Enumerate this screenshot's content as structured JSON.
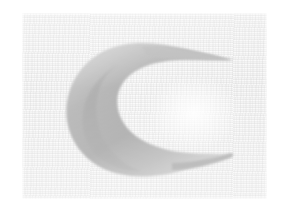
{
  "page": {
    "width": 289,
    "height": 218,
    "background_color": "#ffffff"
  },
  "photo": {
    "name": "scanned-photo-region",
    "left": 22,
    "top": 13,
    "width": 245,
    "height": 186,
    "paper_color": "#f1f1f1",
    "paper_highlight": "#f7f7f7",
    "paper_shadow": "#ebebeb",
    "texture": "horizontal-fibrous-grain",
    "caption": ""
  },
  "artwork": {
    "name": "crescent-moon",
    "subject": "crescent moon",
    "orientation": "opening-faces-right",
    "fill_color": "#b2b2b2",
    "fill_light": "#c8c8c8",
    "fill_dark": "#a4a4a4",
    "edge_softness": "soft-blurred",
    "upper_tip": {
      "x": 210,
      "y": 47
    },
    "lower_tip": {
      "x": 208,
      "y": 142
    },
    "leftmost": {
      "x": 46,
      "y": 96
    },
    "top": {
      "x": 110,
      "y": 30
    },
    "bottom": {
      "x": 118,
      "y": 158
    },
    "inner_glow_color": "#ffffff"
  }
}
